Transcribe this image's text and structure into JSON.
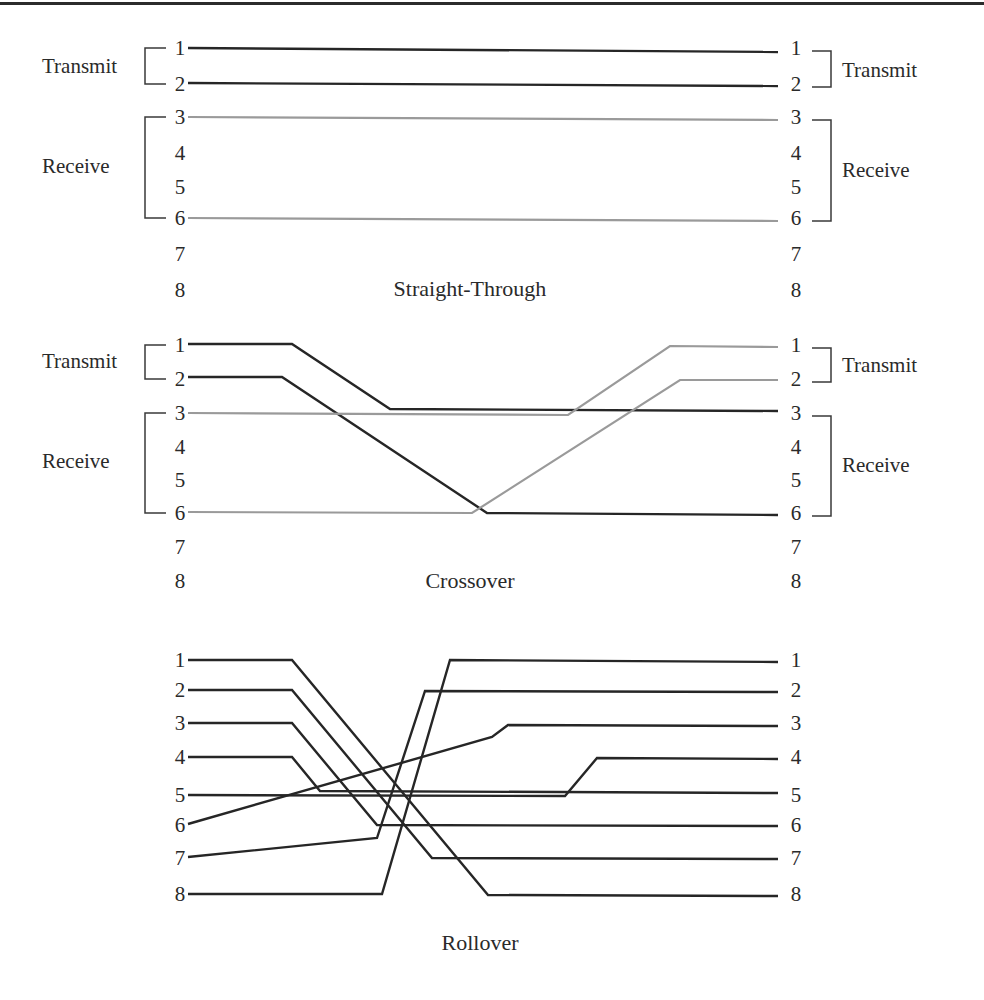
{
  "figure": {
    "colors": {
      "dark_wire": "#262626",
      "gray_wire": "#9a9a9a",
      "text": "#2a2a2a",
      "rule": "#2b2b2b"
    },
    "panels": [
      {
        "id": "straight-through",
        "caption": "Straight-Through",
        "caption_pos": [
          470,
          296
        ],
        "pin_y": [
          48,
          84,
          117,
          153,
          187,
          218,
          254,
          290
        ],
        "left_pin_x": 180,
        "right_pin_x": 796,
        "pins": [
          "1",
          "2",
          "3",
          "4",
          "5",
          "6",
          "7",
          "8"
        ],
        "left_groups": [
          {
            "label": "Transmit",
            "from_pin": 0,
            "to_pin": 1,
            "label_pos": [
              42,
              73
            ]
          },
          {
            "label": "Receive",
            "from_pin": 2,
            "to_pin": 5,
            "label_pos": [
              42,
              173
            ]
          }
        ],
        "right_groups": [
          {
            "label": "Transmit",
            "from_pin": 0,
            "to_pin": 1,
            "label_pos": [
              842,
              77
            ]
          },
          {
            "label": "Receive",
            "from_pin": 2,
            "to_pin": 5,
            "label_pos": [
              842,
              177
            ]
          }
        ],
        "wires": [
          {
            "from": "1",
            "to": "1",
            "style": "dark",
            "points": [
              [
                188,
                48
              ],
              [
                778,
                52
              ]
            ]
          },
          {
            "from": "2",
            "to": "2",
            "style": "dark",
            "points": [
              [
                188,
                83
              ],
              [
                778,
                86
              ]
            ]
          },
          {
            "from": "3",
            "to": "3",
            "style": "gray",
            "points": [
              [
                188,
                117
              ],
              [
                778,
                120
              ]
            ]
          },
          {
            "from": "6",
            "to": "6",
            "style": "gray",
            "points": [
              [
                188,
                218
              ],
              [
                778,
                221
              ]
            ]
          }
        ]
      },
      {
        "id": "crossover",
        "caption": "Crossover",
        "caption_pos": [
          470,
          588
        ],
        "pin_y": [
          345,
          379,
          413,
          447,
          480,
          513,
          547,
          581
        ],
        "left_pin_x": 180,
        "right_pin_x": 796,
        "pins": [
          "1",
          "2",
          "3",
          "4",
          "5",
          "6",
          "7",
          "8"
        ],
        "left_groups": [
          {
            "label": "Transmit",
            "from_pin": 0,
            "to_pin": 1,
            "label_pos": [
              42,
              368
            ]
          },
          {
            "label": "Receive",
            "from_pin": 2,
            "to_pin": 5,
            "label_pos": [
              42,
              468
            ]
          }
        ],
        "right_groups": [
          {
            "label": "Transmit",
            "from_pin": 0,
            "to_pin": 1,
            "label_pos": [
              842,
              372
            ]
          },
          {
            "label": "Receive",
            "from_pin": 2,
            "to_pin": 5,
            "label_pos": [
              842,
              472
            ]
          }
        ],
        "wires": [
          {
            "from": "1",
            "to": "3",
            "style": "dark",
            "points": [
              [
                188,
                344
              ],
              [
                292,
                344
              ],
              [
                390,
                409
              ],
              [
                778,
                411
              ]
            ]
          },
          {
            "from": "2",
            "to": "6",
            "style": "dark",
            "points": [
              [
                188,
                377
              ],
              [
                282,
                377
              ],
              [
                487,
                513
              ],
              [
                778,
                515
              ]
            ]
          },
          {
            "from": "3",
            "to": "1",
            "style": "gray",
            "points": [
              [
                188,
                413
              ],
              [
                568,
                415
              ],
              [
                670,
                346
              ],
              [
                778,
                347
              ]
            ]
          },
          {
            "from": "6",
            "to": "2",
            "style": "gray",
            "points": [
              [
                188,
                512
              ],
              [
                472,
                513
              ],
              [
                680,
                380
              ],
              [
                778,
                380
              ]
            ]
          }
        ]
      },
      {
        "id": "rollover",
        "caption": "Rollover",
        "caption_pos": [
          480,
          950
        ],
        "pin_y": [
          660,
          690,
          723,
          757,
          795,
          825,
          858,
          894
        ],
        "left_pin_x": 180,
        "right_pin_x": 796,
        "pins": [
          "1",
          "2",
          "3",
          "4",
          "5",
          "6",
          "7",
          "8"
        ],
        "left_groups": [],
        "right_groups": [],
        "wires": [
          {
            "from": "1",
            "to": "8",
            "style": "dark",
            "points": [
              [
                188,
                660
              ],
              [
                292,
                660
              ],
              [
                488,
                895
              ],
              [
                778,
                896
              ]
            ]
          },
          {
            "from": "2",
            "to": "7",
            "style": "dark",
            "points": [
              [
                188,
                690
              ],
              [
                292,
                690
              ],
              [
                432,
                858
              ],
              [
                778,
                859
              ]
            ]
          },
          {
            "from": "3",
            "to": "6",
            "style": "dark",
            "points": [
              [
                188,
                723
              ],
              [
                292,
                723
              ],
              [
                377,
                825
              ],
              [
                778,
                826
              ]
            ]
          },
          {
            "from": "4",
            "to": "5",
            "style": "dark",
            "points": [
              [
                188,
                757
              ],
              [
                292,
                757
              ],
              [
                320,
                791
              ],
              [
                778,
                793
              ]
            ]
          },
          {
            "from": "5",
            "to": "4",
            "style": "dark",
            "points": [
              [
                188,
                795
              ],
              [
                565,
                796
              ],
              [
                597,
                758
              ],
              [
                778,
                759
              ]
            ]
          },
          {
            "from": "6",
            "to": "3",
            "style": "dark",
            "points": [
              [
                188,
                824
              ],
              [
                492,
                737
              ],
              [
                508,
                725
              ],
              [
                778,
                726
              ]
            ]
          },
          {
            "from": "7",
            "to": "2",
            "style": "dark",
            "points": [
              [
                188,
                857
              ],
              [
                377,
                838
              ],
              [
                425,
                691
              ],
              [
                778,
                692
              ]
            ]
          },
          {
            "from": "8",
            "to": "1",
            "style": "dark",
            "points": [
              [
                188,
                894
              ],
              [
                382,
                894
              ],
              [
                450,
                660
              ],
              [
                778,
                662
              ]
            ]
          }
        ]
      }
    ]
  }
}
